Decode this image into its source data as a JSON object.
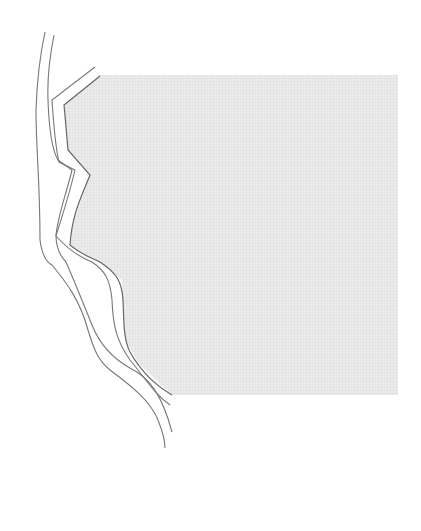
{
  "map": {
    "width": 421,
    "height": 531,
    "colors": {
      "background": "#ffffff",
      "shaded_area": "#e6e6e6",
      "shaded_pattern": "#d6d6d6",
      "line": "#777777"
    },
    "shaded_region": {
      "label": "shaded land area",
      "points": "100,75 398,75 398,395 172,395 140,365 125,340 122,280 100,262 70,245 72,225 90,175 68,150 64,105"
    },
    "contour_lines": [
      {
        "name": "outer-contour-1",
        "d": "M45,32 C40,55 37,80 36,110 C36,150 40,180 40,240 C42,255 46,262 52,265 C66,282 80,300 88,330 C94,350 98,360 110,370 C130,385 150,400 158,420 C162,430 165,440 165,448"
      },
      {
        "name": "outer-contour-2",
        "d": "M54,35 C50,55 47,75 48,100 C49,130 52,150 58,160 L72,170 C66,195 58,215 56,235 C56,250 62,258 66,262 C76,285 84,305 92,325 C100,345 112,358 130,368 C150,378 162,395 172,432"
      },
      {
        "name": "inner-contour",
        "d": "M95,67 L52,100 C54,130 56,150 59,162 L75,170 C68,200 60,222 56,236 C70,252 82,258 92,262 C104,270 110,278 112,300 C113,325 116,340 130,360 C145,378 155,395 170,405"
      },
      {
        "name": "shaded-edge",
        "d": "M100,76 L64,105 C66,125 67,140 68,150 L90,175 C80,200 72,215 70,245 C82,255 92,258 100,262 C115,272 122,280 123,300 C124,320 123,338 130,352 C140,370 155,385 172,395"
      }
    ]
  }
}
